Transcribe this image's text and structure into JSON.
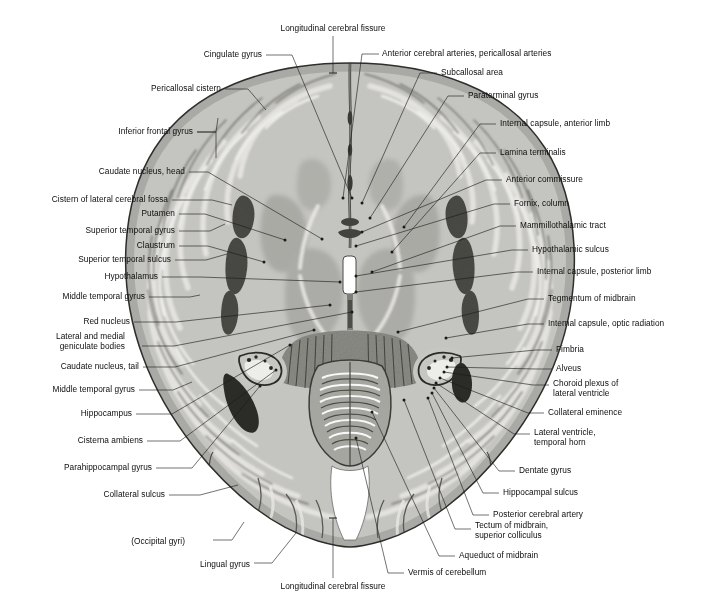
{
  "figure": {
    "view": "axial-section",
    "orientation": "anterior at top, posterior at bottom"
  },
  "midline_labels": [
    {
      "id": "long-fissure-top",
      "text": "Longitudinal cerebral fissure",
      "x": 333,
      "y": 28,
      "anchor": "center"
    },
    {
      "id": "long-fissure-bottom",
      "text": "Longitudinal cerebral fissure",
      "x": 333,
      "y": 586,
      "anchor": "center"
    }
  ],
  "left_labels": [
    {
      "id": "cingulate-gyrus",
      "text": "Cingulate gyrus",
      "x": 262,
      "y": 54,
      "lines": 1
    },
    {
      "id": "pericallosal-cistern",
      "text": "Pericallosal cistern",
      "x": 221,
      "y": 88,
      "lines": 1
    },
    {
      "id": "inferior-frontal-gyrus",
      "text": "Inferior frontal gyrus",
      "x": 193,
      "y": 131,
      "lines": 1
    },
    {
      "id": "caudate-nucleus-head",
      "text": "Caudate nucleus, head",
      "x": 185,
      "y": 171,
      "lines": 1
    },
    {
      "id": "cistern-lateral-cerebral-fossa",
      "text": "Cistern of lateral cerebral fossa",
      "x": 168,
      "y": 199,
      "lines": 1
    },
    {
      "id": "putamen",
      "text": "Putamen",
      "x": 175,
      "y": 213,
      "lines": 1
    },
    {
      "id": "superior-temporal-gyrus",
      "text": "Superior temporal gyrus",
      "x": 175,
      "y": 230,
      "lines": 1
    },
    {
      "id": "claustrum",
      "text": "Claustrum",
      "x": 175,
      "y": 245,
      "lines": 1
    },
    {
      "id": "superior-temporal-sulcus",
      "text": "Superior temporal sulcus",
      "x": 171,
      "y": 259,
      "lines": 1
    },
    {
      "id": "hypothalamus",
      "text": "Hypothalamus",
      "x": 158,
      "y": 276,
      "lines": 1
    },
    {
      "id": "middle-temporal-gyrus-1",
      "text": "Middle temporal gyrus",
      "x": 145,
      "y": 296,
      "lines": 1
    },
    {
      "id": "red-nucleus",
      "text": "Red nucleus",
      "x": 130,
      "y": 321,
      "lines": 1
    },
    {
      "id": "lateral-medial-geniculate",
      "text": "Lateral and medial\ngeniculate bodies",
      "x": 125,
      "y": 341,
      "lines": 2
    },
    {
      "id": "caudate-nucleus-tail",
      "text": "Caudate nucleus, tail",
      "x": 139,
      "y": 366,
      "lines": 1
    },
    {
      "id": "middle-temporal-gyrus-2",
      "text": "Middle temporal gyrus",
      "x": 135,
      "y": 389,
      "lines": 1
    },
    {
      "id": "hippocampus",
      "text": "Hippocampus",
      "x": 132,
      "y": 413,
      "lines": 1
    },
    {
      "id": "cisterna-ambiens",
      "text": "Cisterna ambiens",
      "x": 143,
      "y": 440,
      "lines": 1
    },
    {
      "id": "parahippocampal-gyrus",
      "text": "Parahippocampal gyrus",
      "x": 152,
      "y": 467,
      "lines": 1
    },
    {
      "id": "collateral-sulcus",
      "text": "Collateral sulcus",
      "x": 165,
      "y": 494,
      "lines": 1
    },
    {
      "id": "occipital-gyri",
      "text": "(Occipital gyri)",
      "x": 185,
      "y": 541,
      "lines": 1
    },
    {
      "id": "lingual-gyrus",
      "text": "Lingual gyrus",
      "x": 250,
      "y": 564,
      "lines": 1
    }
  ],
  "right_labels": [
    {
      "id": "anterior-cerebral-arteries",
      "text": "Anterior cerebral arteries, pericallosal arteries",
      "x": 382,
      "y": 53,
      "lines": 1
    },
    {
      "id": "subcallosal-area",
      "text": "Subcallosal area",
      "x": 441,
      "y": 72,
      "lines": 1
    },
    {
      "id": "paraterminal-gyrus",
      "text": "Paraterminal gyrus",
      "x": 468,
      "y": 95,
      "lines": 1
    },
    {
      "id": "internal-capsule-anterior",
      "text": "Internal capsule, anterior limb",
      "x": 500,
      "y": 123,
      "lines": 1
    },
    {
      "id": "lamina-terminalis",
      "text": "Lamina terminalis",
      "x": 500,
      "y": 152,
      "lines": 1
    },
    {
      "id": "anterior-commissure",
      "text": "Anterior commissure",
      "x": 506,
      "y": 179,
      "lines": 1
    },
    {
      "id": "fornix-column",
      "text": "Fornix, column",
      "x": 514,
      "y": 203,
      "lines": 1
    },
    {
      "id": "mammillothalamic-tract",
      "text": "Mammillothalamic tract",
      "x": 520,
      "y": 225,
      "lines": 1
    },
    {
      "id": "hypothalamic-sulcus",
      "text": "Hypothalamic sulcus",
      "x": 532,
      "y": 249,
      "lines": 1
    },
    {
      "id": "internal-capsule-posterior",
      "text": "Internal capsule, posterior limb",
      "x": 537,
      "y": 271,
      "lines": 1
    },
    {
      "id": "tegmentum-of-midbrain",
      "text": "Tegmentum of midbrain",
      "x": 548,
      "y": 298,
      "lines": 1
    },
    {
      "id": "internal-capsule-optic",
      "text": "Internal capsule, optic radiation",
      "x": 548,
      "y": 323,
      "lines": 1
    },
    {
      "id": "fimbria",
      "text": "Fimbria",
      "x": 556,
      "y": 349,
      "lines": 1
    },
    {
      "id": "alveus",
      "text": "Alveus",
      "x": 556,
      "y": 368,
      "lines": 1
    },
    {
      "id": "choroid-plexus",
      "text": "Choroid plexus of\nlateral ventricle",
      "x": 553,
      "y": 388,
      "lines": 2
    },
    {
      "id": "collateral-eminence",
      "text": "Collateral eminence",
      "x": 548,
      "y": 412,
      "lines": 1
    },
    {
      "id": "lateral-ventricle-temporal",
      "text": "Lateral ventricle,\ntemporal horn",
      "x": 534,
      "y": 437,
      "lines": 2
    },
    {
      "id": "dentate-gyrus",
      "text": "Dentate gyrus",
      "x": 519,
      "y": 470,
      "lines": 1
    },
    {
      "id": "hippocampal-sulcus",
      "text": "Hippocampal sulcus",
      "x": 503,
      "y": 492,
      "lines": 1
    },
    {
      "id": "posterior-cerebral-artery",
      "text": "Posterior cerebral artery",
      "x": 493,
      "y": 514,
      "lines": 1
    },
    {
      "id": "tectum-of-midbrain",
      "text": "Tectum of midbrain,\nsuperior colliculus",
      "x": 475,
      "y": 530,
      "lines": 2
    },
    {
      "id": "aqueduct-of-midbrain",
      "text": "Aqueduct of midbrain",
      "x": 459,
      "y": 555,
      "lines": 1
    },
    {
      "id": "vermis-of-cerebellum",
      "text": "Vermis of cerebellum",
      "x": 408,
      "y": 572,
      "lines": 1
    }
  ],
  "colors": {
    "background": "#ffffff",
    "text": "#0d0d0d",
    "leader": "#1a1a1a",
    "tissue_light": "#c9c9c6",
    "tissue_mid": "#b0b0ac",
    "tissue_dark": "#8e8e8a",
    "white_matter": "#dedddb",
    "ventricle": "#ffffff",
    "outline": "#2a2a28"
  }
}
